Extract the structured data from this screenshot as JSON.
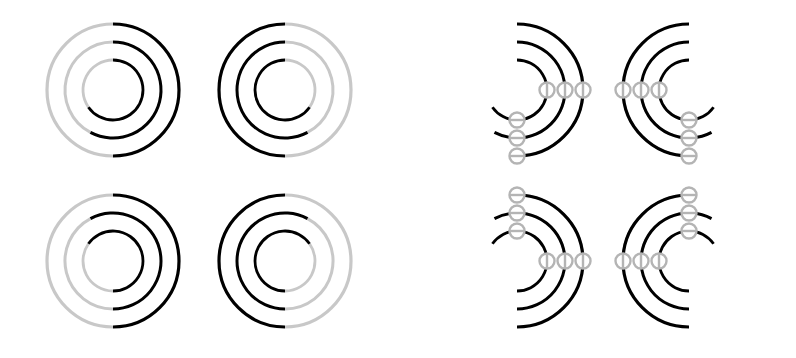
{
  "figure": {
    "background_color": "#ffffff",
    "width": 796,
    "height": 358,
    "colors": {
      "arc_solid": "#000000",
      "arc_faded": "#c8c8c8",
      "node_stroke": "#b4b4b4",
      "node_fill": "#ffffff",
      "connector": "#c0c0c0"
    },
    "geometry": {
      "radii": [
        66,
        48,
        30
      ],
      "ring_count": 3,
      "stroke_width_outer": 3.2,
      "stroke_width_mid": 3.0,
      "stroke_width_inner": 2.8,
      "node_radius": 7.5,
      "node_stroke_width": 2.4,
      "connector_stroke_width": 2.6
    },
    "groups": [
      {
        "id": "group-left",
        "name": "plain-rings",
        "has_nodes": false,
        "panels": [
          {
            "id": "panel-tl",
            "name": "panel-top-left",
            "cx": 113,
            "cy": 90,
            "mirror_x": false,
            "mirror_y": false,
            "solid_arcs_deg": [
              {
                "ring": 0,
                "start": -90,
                "end": 90
              },
              {
                "ring": 1,
                "start": -90,
                "end": 118
              },
              {
                "ring": 2,
                "start": -90,
                "end": 145
              }
            ],
            "faded_arcs_deg": [
              {
                "ring": 0,
                "start": 90,
                "end": 270
              },
              {
                "ring": 1,
                "start": 118,
                "end": 270
              },
              {
                "ring": 2,
                "start": 145,
                "end": 270
              }
            ],
            "nodes": []
          },
          {
            "id": "panel-tr",
            "name": "panel-top-right",
            "cx": 285,
            "cy": 90,
            "mirror_x": true,
            "mirror_y": false,
            "solid_arcs_deg": [
              {
                "ring": 0,
                "start": -90,
                "end": 90
              },
              {
                "ring": 1,
                "start": -90,
                "end": 118
              },
              {
                "ring": 2,
                "start": -90,
                "end": 145
              }
            ],
            "faded_arcs_deg": [
              {
                "ring": 0,
                "start": 90,
                "end": 270
              },
              {
                "ring": 1,
                "start": 118,
                "end": 270
              },
              {
                "ring": 2,
                "start": 145,
                "end": 270
              }
            ],
            "nodes": []
          },
          {
            "id": "panel-bl",
            "name": "panel-bottom-left",
            "cx": 113,
            "cy": 261,
            "mirror_x": false,
            "mirror_y": true,
            "solid_arcs_deg": [
              {
                "ring": 0,
                "start": -90,
                "end": 90
              },
              {
                "ring": 1,
                "start": -90,
                "end": 118
              },
              {
                "ring": 2,
                "start": -90,
                "end": 145
              }
            ],
            "faded_arcs_deg": [
              {
                "ring": 0,
                "start": 90,
                "end": 270
              },
              {
                "ring": 1,
                "start": 118,
                "end": 270
              },
              {
                "ring": 2,
                "start": 145,
                "end": 270
              }
            ],
            "nodes": []
          },
          {
            "id": "panel-br",
            "name": "panel-bottom-right",
            "cx": 285,
            "cy": 261,
            "mirror_x": true,
            "mirror_y": true,
            "solid_arcs_deg": [
              {
                "ring": 0,
                "start": -90,
                "end": 90
              },
              {
                "ring": 1,
                "start": -90,
                "end": 118
              },
              {
                "ring": 2,
                "start": -90,
                "end": 145
              }
            ],
            "faded_arcs_deg": [
              {
                "ring": 0,
                "start": 90,
                "end": 270
              },
              {
                "ring": 1,
                "start": 118,
                "end": 270
              },
              {
                "ring": 2,
                "start": 145,
                "end": 270
              }
            ],
            "nodes": []
          }
        ]
      },
      {
        "id": "group-right",
        "name": "annotated-rings-with-nodes",
        "has_nodes": true,
        "panels": [
          {
            "id": "panel-tl-nodes",
            "name": "panel-top-left-nodes",
            "cx": 517,
            "cy": 90,
            "mirror_x": false,
            "mirror_y": false,
            "solid_arcs_deg": [
              {
                "ring": 0,
                "start": -90,
                "end": 90
              },
              {
                "ring": 1,
                "start": -90,
                "end": 118
              },
              {
                "ring": 2,
                "start": -90,
                "end": 145
              }
            ],
            "faded_arcs_deg": [],
            "nodes": [
              {
                "name": "node-outer-end",
                "ring": 0,
                "angle": 0,
                "marker": "vertical"
              },
              {
                "name": "node-mid-end",
                "ring": 1,
                "angle": 0,
                "marker": "vertical"
              },
              {
                "name": "node-inner-end",
                "ring": 2,
                "angle": 0,
                "marker": "vertical"
              },
              {
                "name": "node-inner-drop",
                "ring": 2,
                "angle": 90,
                "marker": "horizontal"
              },
              {
                "name": "node-mid-drop",
                "ring": 1,
                "angle": 90,
                "marker": "horizontal"
              },
              {
                "name": "node-outer-drop",
                "ring": 0,
                "angle": 90,
                "marker": "horizontal"
              }
            ],
            "connectors": [
              {
                "from_ring": 0,
                "to_ring": 0
              },
              {
                "from_ring": 1,
                "to_ring": 1
              },
              {
                "from_ring": 2,
                "to_ring": 2
              }
            ]
          },
          {
            "id": "panel-tr-nodes",
            "name": "panel-top-right-nodes",
            "cx": 689,
            "cy": 90,
            "mirror_x": true,
            "mirror_y": false,
            "solid_arcs_deg": [
              {
                "ring": 0,
                "start": -90,
                "end": 90
              },
              {
                "ring": 1,
                "start": -90,
                "end": 118
              },
              {
                "ring": 2,
                "start": -90,
                "end": 145
              }
            ],
            "faded_arcs_deg": [],
            "nodes": [
              {
                "name": "node-outer-end",
                "ring": 0,
                "angle": 0,
                "marker": "vertical"
              },
              {
                "name": "node-mid-end",
                "ring": 1,
                "angle": 0,
                "marker": "vertical"
              },
              {
                "name": "node-inner-end",
                "ring": 2,
                "angle": 0,
                "marker": "vertical"
              },
              {
                "name": "node-inner-drop",
                "ring": 2,
                "angle": 90,
                "marker": "horizontal"
              },
              {
                "name": "node-mid-drop",
                "ring": 1,
                "angle": 90,
                "marker": "horizontal"
              },
              {
                "name": "node-outer-drop",
                "ring": 0,
                "angle": 90,
                "marker": "horizontal"
              }
            ],
            "connectors": [
              {
                "from_ring": 0,
                "to_ring": 0
              },
              {
                "from_ring": 1,
                "to_ring": 1
              },
              {
                "from_ring": 2,
                "to_ring": 2
              }
            ]
          },
          {
            "id": "panel-bl-nodes",
            "name": "panel-bottom-left-nodes",
            "cx": 517,
            "cy": 261,
            "mirror_x": false,
            "mirror_y": true,
            "solid_arcs_deg": [
              {
                "ring": 0,
                "start": -90,
                "end": 90
              },
              {
                "ring": 1,
                "start": -90,
                "end": 118
              },
              {
                "ring": 2,
                "start": -90,
                "end": 145
              }
            ],
            "faded_arcs_deg": [],
            "nodes": [
              {
                "name": "node-outer-end",
                "ring": 0,
                "angle": 0,
                "marker": "vertical"
              },
              {
                "name": "node-mid-end",
                "ring": 1,
                "angle": 0,
                "marker": "vertical"
              },
              {
                "name": "node-inner-end",
                "ring": 2,
                "angle": 0,
                "marker": "vertical"
              },
              {
                "name": "node-inner-drop",
                "ring": 2,
                "angle": 90,
                "marker": "horizontal"
              },
              {
                "name": "node-mid-drop",
                "ring": 1,
                "angle": 90,
                "marker": "horizontal"
              },
              {
                "name": "node-outer-drop",
                "ring": 0,
                "angle": 90,
                "marker": "horizontal"
              }
            ],
            "connectors": [
              {
                "from_ring": 0,
                "to_ring": 0
              },
              {
                "from_ring": 1,
                "to_ring": 1
              },
              {
                "from_ring": 2,
                "to_ring": 2
              }
            ]
          },
          {
            "id": "panel-br-nodes",
            "name": "panel-bottom-right-nodes",
            "cx": 689,
            "cy": 261,
            "mirror_x": true,
            "mirror_y": true,
            "solid_arcs_deg": [
              {
                "ring": 0,
                "start": -90,
                "end": 90
              },
              {
                "ring": 1,
                "start": -90,
                "end": 118
              },
              {
                "ring": 2,
                "start": -90,
                "end": 145
              }
            ],
            "faded_arcs_deg": [],
            "nodes": [
              {
                "name": "node-outer-end",
                "ring": 0,
                "angle": 0,
                "marker": "vertical"
              },
              {
                "name": "node-mid-end",
                "ring": 1,
                "angle": 0,
                "marker": "vertical"
              },
              {
                "name": "node-inner-end",
                "ring": 2,
                "angle": 0,
                "marker": "vertical"
              },
              {
                "name": "node-inner-drop",
                "ring": 2,
                "angle": 90,
                "marker": "horizontal"
              },
              {
                "name": "node-mid-drop",
                "ring": 1,
                "angle": 90,
                "marker": "horizontal"
              },
              {
                "name": "node-outer-drop",
                "ring": 0,
                "angle": 90,
                "marker": "horizontal"
              }
            ],
            "connectors": [
              {
                "from_ring": 0,
                "to_ring": 0
              },
              {
                "from_ring": 1,
                "to_ring": 1
              },
              {
                "from_ring": 2,
                "to_ring": 2
              }
            ]
          }
        ]
      }
    ]
  }
}
